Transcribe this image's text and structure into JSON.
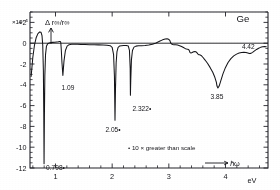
{
  "figure": {
    "material_label": "Ge",
    "exponent_label": "×10⁻⁵",
    "y_axis_label": "Δ r∞/r∞",
    "x_unit_label": "eV",
    "energy_arrow_label": "ℏω",
    "footnote": "• 10 × greater  than  scale"
  },
  "chart_data": {
    "type": "line",
    "title": "Ge",
    "subtitle": "",
    "xlabel": "eV",
    "ylabel": "Δ r∞/r∞",
    "y_scale_factor": "×10⁻⁵",
    "xlim": [
      0.55,
      4.75
    ],
    "ylim": [
      -12,
      3
    ],
    "grid": false,
    "legend": "none",
    "xticks": [
      1,
      2,
      3,
      4
    ],
    "xtick_labels": [
      "1",
      "2",
      "3",
      "4"
    ],
    "yticks": [
      2,
      0,
      -2,
      -4,
      -6,
      -8,
      -10,
      -12
    ],
    "ytick_labels": [
      "+2",
      "0",
      "-2",
      "-4",
      "-6",
      "-8",
      "-10",
      "-12"
    ],
    "x_minor_tick_step": 0.2,
    "y_minor_tick_step": 0.5,
    "annotations": [
      {
        "label": "0.798•",
        "energy_eV": 0.798,
        "marked_greater_than_scale": true,
        "depth": -11.6
      },
      {
        "label": "1.09",
        "energy_eV": 1.09,
        "marked_greater_than_scale": false,
        "depth": -3.1
      },
      {
        "label": "2.05•",
        "energy_eV": 2.05,
        "marked_greater_than_scale": true,
        "depth": -7.4
      },
      {
        "label": "2.322•",
        "energy_eV": 2.322,
        "marked_greater_than_scale": true,
        "depth": -5.0
      },
      {
        "label": "3.85",
        "energy_eV": 3.85,
        "marked_greater_than_scale": false,
        "depth": -4.3
      },
      {
        "label": "4.42",
        "energy_eV": 4.42,
        "marked_greater_than_scale": false,
        "depth": -1.0
      }
    ],
    "series": [
      {
        "name": "Δr∞/r∞ spectrum of Ge",
        "x": [
          0.57,
          0.6,
          0.63,
          0.66,
          0.69,
          0.72,
          0.745,
          0.762,
          0.775,
          0.786,
          0.793,
          0.798,
          0.804,
          0.812,
          0.824,
          0.84,
          0.862,
          0.89,
          0.92,
          0.95,
          0.985,
          1.02,
          1.05,
          1.068,
          1.08,
          1.088,
          1.09,
          1.094,
          1.102,
          1.114,
          1.13,
          1.15,
          1.175,
          1.205,
          1.24,
          1.285,
          1.33,
          1.39,
          1.45,
          1.52,
          1.6,
          1.68,
          1.76,
          1.84,
          1.91,
          1.965,
          2.0,
          2.025,
          2.04,
          2.05,
          2.058,
          2.07,
          2.085,
          2.105,
          2.13,
          2.165,
          2.205,
          2.25,
          2.285,
          2.305,
          2.318,
          2.322,
          2.328,
          2.34,
          2.358,
          2.385,
          2.42,
          2.465,
          2.52,
          2.58,
          2.645,
          2.71,
          2.775,
          2.835,
          2.89,
          2.935,
          2.97,
          2.995,
          3.012,
          3.022,
          3.03,
          3.045,
          3.065,
          3.09,
          3.12,
          3.155,
          3.19,
          3.225,
          3.258,
          3.285,
          3.31,
          3.335,
          3.352,
          3.362,
          3.372,
          3.39,
          3.412,
          3.438,
          3.462,
          3.485,
          3.502,
          3.515,
          3.528,
          3.545,
          3.57,
          3.6,
          3.64,
          3.685,
          3.73,
          3.775,
          3.812,
          3.838,
          3.85,
          3.866,
          3.888,
          3.918,
          3.955,
          3.998,
          4.045,
          4.095,
          4.145,
          4.195,
          4.24,
          4.285,
          4.325,
          4.362,
          4.395,
          4.42,
          4.448,
          4.478,
          4.512,
          4.548,
          4.585,
          4.62,
          4.655,
          4.69,
          4.72
        ],
        "y": [
          -3.2,
          -1.35,
          -0.15,
          0.55,
          0.92,
          1.08,
          1.05,
          0.72,
          -0.2,
          -2.6,
          -6.6,
          -11.6,
          -7.2,
          -3.1,
          -1.1,
          -0.3,
          -0.05,
          0.02,
          0.06,
          0.08,
          0.1,
          0.12,
          0.14,
          0.16,
          0.16,
          0.14,
          0.12,
          0.02,
          -0.6,
          -1.85,
          -3.1,
          -1.7,
          -0.7,
          -0.28,
          -0.14,
          -0.1,
          -0.1,
          -0.11,
          -0.12,
          -0.13,
          -0.14,
          -0.15,
          -0.16,
          -0.17,
          -0.19,
          -0.24,
          -0.4,
          -1.1,
          -3.2,
          -7.4,
          -4.6,
          -1.9,
          -0.8,
          -0.4,
          -0.28,
          -0.24,
          -0.22,
          -0.22,
          -0.28,
          -0.7,
          -2.4,
          -5.0,
          -3.6,
          -1.6,
          -0.7,
          -0.38,
          -0.28,
          -0.25,
          -0.24,
          -0.22,
          -0.18,
          -0.1,
          0.02,
          0.18,
          0.32,
          0.4,
          0.42,
          0.38,
          0.3,
          0.2,
          0.06,
          -0.06,
          -0.12,
          -0.14,
          -0.15,
          -0.18,
          -0.24,
          -0.32,
          -0.42,
          -0.5,
          -0.55,
          -0.58,
          -0.62,
          -0.72,
          -0.88,
          -0.95,
          -0.9,
          -0.82,
          -0.8,
          -0.85,
          -0.95,
          -1.05,
          -1.1,
          -1.12,
          -1.18,
          -1.35,
          -1.62,
          -1.95,
          -2.35,
          -2.8,
          -3.28,
          -3.75,
          -4.12,
          -4.3,
          -4.12,
          -3.6,
          -2.95,
          -2.35,
          -1.85,
          -1.48,
          -1.22,
          -1.05,
          -0.95,
          -0.9,
          -0.88,
          -0.9,
          -0.95,
          -1.0,
          -0.98,
          -0.88,
          -0.74,
          -0.6,
          -0.48,
          -0.4,
          -0.35,
          -0.33,
          -0.34
        ]
      }
    ]
  }
}
